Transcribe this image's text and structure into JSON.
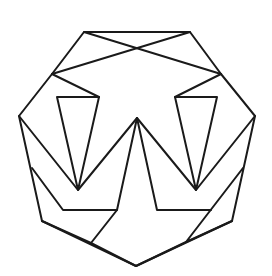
{
  "diagram": {
    "title": "",
    "stroke_color": "#1a1a1a",
    "background": "#ffffff",
    "outer_octagon": [
      [
        84,
        32
      ],
      [
        190,
        32
      ],
      [
        221,
        74
      ],
      [
        255,
        116
      ],
      [
        232,
        221
      ],
      [
        136,
        266
      ],
      [
        42,
        221
      ],
      [
        19,
        116
      ],
      [
        52,
        74
      ]
    ],
    "polylines": [
      [
        [
          52,
          74
        ],
        [
          190,
          32
        ]
      ],
      [
        [
          221,
          74
        ],
        [
          84,
          32
        ]
      ],
      [
        [
          52,
          74
        ],
        [
          99,
          97
        ]
      ],
      [
        [
          221,
          74
        ],
        [
          175,
          97
        ]
      ],
      [
        [
          57,
          97
        ],
        [
          99,
          97
        ],
        [
          78,
          190
        ],
        [
          57,
          97
        ]
      ],
      [
        [
          175,
          97
        ],
        [
          217,
          97
        ],
        [
          196,
          190
        ],
        [
          175,
          97
        ]
      ],
      [
        [
          19,
          116
        ],
        [
          78,
          190
        ],
        [
          137,
          118
        ],
        [
          196,
          190
        ],
        [
          255,
          116
        ]
      ],
      [
        [
          137,
          118
        ],
        [
          117,
          210
        ],
        [
          63,
          210
        ],
        [
          32,
          168
        ]
      ],
      [
        [
          137,
          118
        ],
        [
          157,
          210
        ],
        [
          211,
          210
        ]
      ],
      [
        [
          117,
          210
        ],
        [
          91,
          243
        ],
        [
          42,
          221
        ]
      ],
      [
        [
          243,
          168
        ],
        [
          186,
          242
        ],
        [
          232,
          221
        ]
      ],
      [
        [
          91,
          243
        ],
        [
          136,
          266
        ],
        [
          186,
          242
        ]
      ]
    ]
  }
}
